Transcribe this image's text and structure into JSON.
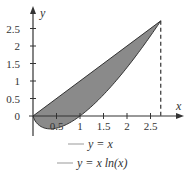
{
  "chart_data": {
    "type": "area",
    "title": "",
    "xlabel": "x",
    "ylabel": "y",
    "xlim": [
      0,
      2.718
    ],
    "ylim": [
      -0.37,
      2.718
    ],
    "xticks": [
      "0.5",
      "1",
      "1.5",
      "2",
      "2.5"
    ],
    "yticks": [
      "0",
      "0.5",
      "1",
      "1.5",
      "2",
      "2.5"
    ],
    "grid": false,
    "legend_position": "below",
    "series": [
      {
        "name": "y = x",
        "function": "x",
        "x": [
          0,
          0.5,
          1,
          1.5,
          2,
          2.5,
          2.718
        ],
        "values": [
          0,
          0.5,
          1,
          1.5,
          2,
          2.5,
          2.718
        ]
      },
      {
        "name": "y = x ln(x)",
        "function": "x*ln(x)",
        "x": [
          0,
          0.368,
          0.5,
          1,
          1.5,
          2,
          2.5,
          2.718
        ],
        "values": [
          0,
          -0.368,
          -0.347,
          0,
          0.608,
          1.386,
          2.291,
          2.718
        ]
      }
    ],
    "shaded_region": {
      "between": [
        "y = x",
        "y = x ln(x)"
      ],
      "x_from": 0,
      "x_to": 2.718,
      "color": "#8a8a8a"
    },
    "annotations": [
      {
        "type": "dashed-vertical-line",
        "x": 2.718
      }
    ]
  },
  "axes": {
    "x_label": "x",
    "y_label": "y",
    "origin_label": "0"
  },
  "legend": [
    {
      "label_lhs": "y",
      "label_rhs": " = x"
    },
    {
      "label_lhs": "y",
      "label_rhs": " = x ln(x)"
    }
  ],
  "colors": {
    "fill": "#8a8a8a",
    "line": "#333333",
    "legend_line": "#999999"
  }
}
